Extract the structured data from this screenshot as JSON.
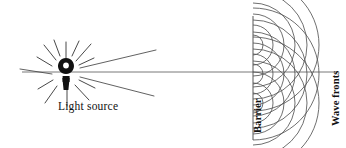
{
  "figure": {
    "background_color": "#ffffff",
    "ink_color": "#111111",
    "width": 346,
    "height": 148
  },
  "labels": {
    "light_source": "Light source",
    "barrier": "Barrier",
    "wave_fronts": "Wave fronts"
  },
  "light_source": {
    "name": "light-source-glyph",
    "shape": "keyhole",
    "center_x": 66,
    "center_y": 72,
    "fill": "#111111",
    "short_ray_count": 12,
    "long_ray_count": 3
  },
  "barrier": {
    "x": 253,
    "y_top": 16,
    "y_bottom": 140,
    "stroke": "#444444"
  },
  "axis": {
    "name": "optical-axis",
    "x_start": 20,
    "x_end": 338,
    "y": 72
  },
  "wavelets": {
    "source_points_y": [
      45,
      74,
      103
    ],
    "arc_radii": [
      10,
      20,
      31,
      42,
      54,
      66
    ],
    "stroke": "#555555"
  }
}
